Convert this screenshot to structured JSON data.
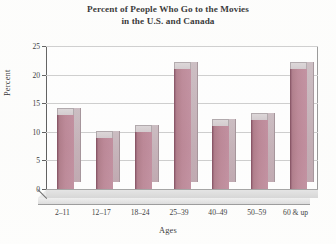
{
  "chart_data": {
    "type": "bar",
    "title": "Percent of People Who Go to the Movies in the U.S. and Canada",
    "title_lines": [
      "Percent of People Who Go to the Movies",
      "in the U.S. and Canada"
    ],
    "xlabel": "Ages",
    "ylabel": "Percent",
    "categories": [
      "2–11",
      "12–17",
      "18–24",
      "25–39",
      "40–49",
      "50–59",
      "60 & up"
    ],
    "values": [
      13,
      9,
      10,
      21,
      11,
      12,
      21
    ],
    "ylim": [
      0,
      25
    ],
    "yticks": [
      0,
      5,
      10,
      15,
      20,
      25
    ],
    "ytick_labels": [
      "0",
      "5",
      "10",
      "15",
      "20",
      "25"
    ],
    "grid": true,
    "grid_axis": "y",
    "legend": "none",
    "style": "3d-column",
    "bar_color": "#b57c8d",
    "bar_top_color": "#d2cacd",
    "bar_side_color": "#bda4ad",
    "floor_color": "#dcdcdc",
    "gridline_color": "#c9c9c9",
    "axis_color": "#4e4e4e",
    "background_color": "#fdfdfc"
  }
}
